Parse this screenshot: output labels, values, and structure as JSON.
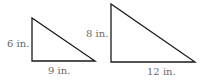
{
  "diagram": {
    "triangles": [
      {
        "name": "small-triangle",
        "vertical_leg": "6 in.",
        "horizontal_leg": "9 in.",
        "points": "32,18 32,61 95,61"
      },
      {
        "name": "large-triangle",
        "vertical_leg": "8 in.",
        "horizontal_leg": "12 in.",
        "points": "111,4 111,62 195,62"
      }
    ],
    "stroke_color": "#1a1a1a",
    "label_color": "#6a6a6a"
  }
}
